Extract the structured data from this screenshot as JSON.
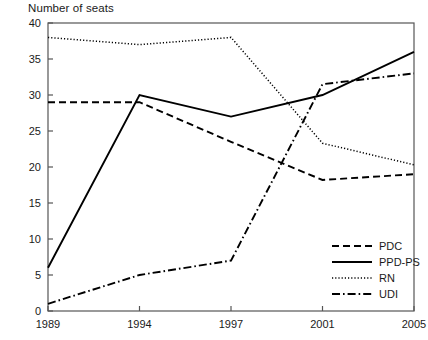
{
  "chart_data": {
    "type": "line",
    "title": "Number of seats",
    "xlabel": "",
    "ylabel": "Number of seats",
    "categories": [
      "1989",
      "1994",
      "1997",
      "2001",
      "2005"
    ],
    "x_tick_labels": [
      "1989",
      "1994",
      "1997",
      "2001",
      "2005"
    ],
    "y_tick_labels": [
      "0",
      "5",
      "10",
      "15",
      "20",
      "25",
      "30",
      "35",
      "40"
    ],
    "y_ticks": [
      0,
      5,
      10,
      15,
      20,
      25,
      30,
      35,
      40
    ],
    "ylim": [
      0,
      40
    ],
    "grid": false,
    "legend_position": "bottom-right",
    "series": [
      {
        "name": "PDC",
        "values": [
          29,
          29,
          23.5,
          18.2,
          19
        ],
        "style": "dashed",
        "color": "#000000"
      },
      {
        "name": "PPD-PS",
        "values": [
          6,
          30,
          27,
          30,
          36
        ],
        "style": "solid",
        "color": "#000000"
      },
      {
        "name": "RN",
        "values": [
          38,
          37,
          38,
          23.3,
          20.3
        ],
        "style": "dotted",
        "color": "#000000"
      },
      {
        "name": "UDI",
        "values": [
          1,
          5,
          7,
          31.5,
          33
        ],
        "style": "dash-dot",
        "color": "#000000"
      }
    ]
  },
  "legend": {
    "items": [
      {
        "label": "PDC"
      },
      {
        "label": "PPD-PS"
      },
      {
        "label": "RN"
      },
      {
        "label": "UDI"
      }
    ]
  },
  "axes": {
    "frame_color": "#555555",
    "tick_color": "#555555"
  }
}
